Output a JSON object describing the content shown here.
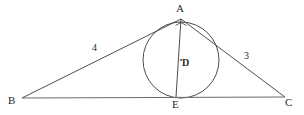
{
  "figure": {
    "background_color": "#ffffff",
    "stroke_color": "#3a3a3a",
    "label_color": "#2b2b2b",
    "width": 304,
    "height": 115
  },
  "labels": {
    "vertex_a": "A",
    "vertex_b": "B",
    "vertex_c": "C",
    "center_d": "D",
    "tangent_e": "E",
    "side_ab": "4",
    "side_ac": "3"
  },
  "geometry": {
    "points": {
      "A": {
        "x": 181,
        "y": 19
      },
      "B": {
        "x": 22,
        "y": 98
      },
      "C": {
        "x": 285,
        "y": 97
      },
      "D": {
        "x": 181,
        "y": 60
      },
      "E": {
        "x": 176,
        "y": 97
      }
    },
    "circle": {
      "center_x": 181,
      "center_y": 60,
      "radius": 38
    },
    "segments": [
      {
        "name": "AB",
        "from": "A",
        "to": "B",
        "label": "4"
      },
      {
        "name": "AC",
        "from": "A",
        "to": "C",
        "label": "3"
      },
      {
        "name": "BC",
        "from": "B",
        "to": "C",
        "label": ""
      },
      {
        "name": "AE",
        "from": "A",
        "to": "E",
        "label": ""
      }
    ],
    "angle_mark_at": "A"
  },
  "chart_data": {
    "type": "diagram",
    "elements": [
      {
        "kind": "triangle",
        "vertices": [
          "B",
          "A",
          "C"
        ]
      },
      {
        "kind": "circle",
        "center": "D",
        "radius": 38,
        "tangent_point": "E"
      },
      {
        "kind": "segment",
        "endpoints": [
          "A",
          "E"
        ],
        "passes_through": "D"
      },
      {
        "kind": "angle-mark",
        "vertex": "A"
      }
    ],
    "side_labels": {
      "AB": "4",
      "AC": "3"
    }
  }
}
